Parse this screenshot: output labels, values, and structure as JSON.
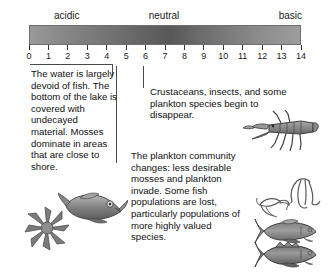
{
  "scale": {
    "labels": {
      "acidic": "acidic",
      "neutral": "neutral",
      "basic": "basic"
    },
    "ticks": [
      "0",
      "1",
      "2",
      "3",
      "4",
      "5",
      "6",
      "7",
      "8",
      "9",
      "10",
      "11",
      "12",
      "13",
      "14"
    ],
    "min": 0,
    "max": 14,
    "gradient_start_color": "#9a9a9a",
    "gradient_mid_color": "#585858",
    "gradient_end_color": "#9d9d9d"
  },
  "annotations": {
    "acidic_zone": {
      "ph_range": "0-5",
      "text": "The water is largely devoid of fish. The bottom of the lake is covered with undecayed material. Mosses dominate in areas that are close to shore."
    },
    "transition_zone": {
      "ph_range": "6",
      "text": "Crustaceans, insects, and some plankton species begin to disappear."
    },
    "plankton_zone": {
      "ph_range": "5-6",
      "text": "The plankton community changes: less desirable mosses and plankton invade. Some fish populations are lost, particularly populations of more highly valued species."
    }
  },
  "illustrations": [
    {
      "name": "fish-dead",
      "label": "fish"
    },
    {
      "name": "moss-plant",
      "label": "moss"
    },
    {
      "name": "crayfish",
      "label": "crayfish"
    },
    {
      "name": "plankton-copepod-small",
      "label": "plankton"
    },
    {
      "name": "plankton-copepod-large",
      "label": "plankton"
    },
    {
      "name": "trout-fish",
      "label": "trout"
    },
    {
      "name": "bass-fish",
      "label": "bass"
    }
  ]
}
